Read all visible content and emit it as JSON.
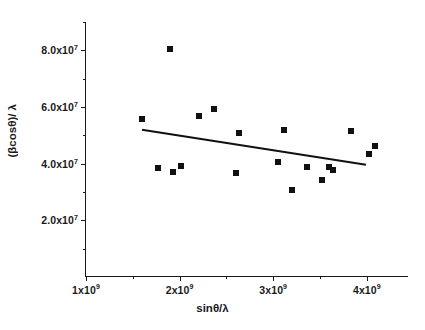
{
  "chart_data": {
    "type": "scatter",
    "title": "",
    "xlabel": "sinθ/λ",
    "ylabel": "(βcosθ)/ λ",
    "xlim": [
      1000000000.0,
      4450000000.0
    ],
    "ylim": [
      0.0,
      90000000.0
    ],
    "grid": false,
    "legend": "none",
    "marker": "filled-square",
    "marker_color": "#111111",
    "line_color": "#111111",
    "x_tick_values": [
      1000000000.0,
      1500000000.0,
      2000000000.0,
      2500000000.0,
      3000000000.0,
      3500000000.0,
      4000000000.0
    ],
    "x_tick_labels": [
      "1x10⁹",
      "",
      "2x10⁹",
      "",
      "3x10⁹",
      "",
      "4x10⁹"
    ],
    "x_major_ticks": [
      {
        "value": 1000000000.0,
        "mantissa": "1x10",
        "exponent": "9"
      },
      {
        "value": 2000000000.0,
        "mantissa": "2x10",
        "exponent": "9"
      },
      {
        "value": 3000000000.0,
        "mantissa": "3x10",
        "exponent": "9"
      },
      {
        "value": 4000000000.0,
        "mantissa": "4x10",
        "exponent": "9"
      }
    ],
    "x_minor_ticks": [
      1500000000.0,
      2500000000.0,
      3500000000.0
    ],
    "y_major_ticks": [
      {
        "value": 20000000.0,
        "mantissa": "2.0x10",
        "exponent": "7"
      },
      {
        "value": 40000000.0,
        "mantissa": "4.0x10",
        "exponent": "7"
      },
      {
        "value": 60000000.0,
        "mantissa": "6.0x10",
        "exponent": "7"
      },
      {
        "value": 80000000.0,
        "mantissa": "8.0x10",
        "exponent": "7"
      }
    ],
    "y_minor_ticks": [
      10000000.0,
      30000000.0,
      50000000.0,
      70000000.0,
      90000000.0
    ],
    "points": [
      {
        "x": 1600000000.0,
        "y": 55700000.0
      },
      {
        "x": 1770000000.0,
        "y": 38500000.0
      },
      {
        "x": 1900000000.0,
        "y": 80300000.0
      },
      {
        "x": 1930000000.0,
        "y": 37000000.0
      },
      {
        "x": 2020000000.0,
        "y": 39300000.0
      },
      {
        "x": 2210000000.0,
        "y": 56800000.0
      },
      {
        "x": 2370000000.0,
        "y": 59200000.0
      },
      {
        "x": 2600000000.0,
        "y": 36700000.0
      },
      {
        "x": 2630000000.0,
        "y": 51000000.0
      },
      {
        "x": 3050000000.0,
        "y": 40700000.0
      },
      {
        "x": 3110000000.0,
        "y": 51800000.0
      },
      {
        "x": 3200000000.0,
        "y": 30700000.0
      },
      {
        "x": 3360000000.0,
        "y": 38800000.0
      },
      {
        "x": 3520000000.0,
        "y": 34400000.0
      },
      {
        "x": 3600000000.0,
        "y": 39000000.0
      },
      {
        "x": 3640000000.0,
        "y": 37700000.0
      },
      {
        "x": 3830000000.0,
        "y": 51500000.0
      },
      {
        "x": 4020000000.0,
        "y": 43500000.0
      },
      {
        "x": 4090000000.0,
        "y": 46300000.0
      }
    ],
    "fit_line": {
      "label": "linear fit",
      "x_start": 1600000000.0,
      "y_start": 51800000.0,
      "x_end": 4000000000.0,
      "y_end": 39400000.0,
      "slope": -0.00517,
      "intercept": 60100000.0
    }
  }
}
